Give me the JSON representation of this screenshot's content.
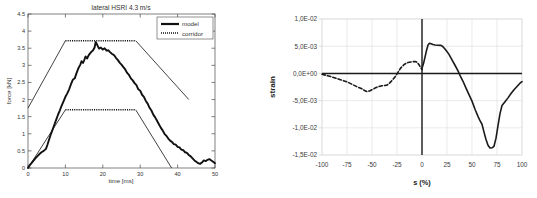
{
  "figure": {
    "background": "#ffffff",
    "panels": [
      "left-force-time-chart",
      "right-strain-s-chart"
    ]
  },
  "chart_data": [
    {
      "id": "lateral-hsri-force-time",
      "type": "line",
      "title": "lateral HSRI 4.3 m/s",
      "xlabel": "time [ms]",
      "ylabel": "force [kN]",
      "xlim": [
        0,
        50
      ],
      "ylim": [
        0,
        4.5
      ],
      "xticks": [
        "0",
        "10",
        "20",
        "30",
        "40",
        "50"
      ],
      "yticks": [
        "0",
        "0.5",
        "1",
        "1.5",
        "2",
        "2.5",
        "3",
        "3.5",
        "4",
        "4.5"
      ],
      "grid": false,
      "legend_position": "top-right",
      "legend": [
        {
          "label": "model",
          "style": "solid",
          "color": "#111111",
          "width": 2.2
        },
        {
          "label": "corridor",
          "style": "dotted",
          "color": "#111111",
          "width": 1.0
        }
      ],
      "series": [
        {
          "name": "model",
          "style": "solid",
          "color": "#111111",
          "points": [
            [
              0.0,
              0.0
            ],
            [
              0.6,
              0.1
            ],
            [
              1.2,
              0.18
            ],
            [
              1.8,
              0.26
            ],
            [
              2.4,
              0.33
            ],
            [
              3.0,
              0.4
            ],
            [
              3.6,
              0.46
            ],
            [
              4.2,
              0.5
            ],
            [
              4.8,
              0.56
            ],
            [
              5.2,
              0.68
            ],
            [
              5.6,
              0.82
            ],
            [
              6.0,
              0.95
            ],
            [
              6.5,
              1.1
            ],
            [
              7.0,
              1.25
            ],
            [
              7.5,
              1.4
            ],
            [
              8.0,
              1.55
            ],
            [
              8.5,
              1.68
            ],
            [
              9.0,
              1.82
            ],
            [
              9.5,
              1.95
            ],
            [
              10.0,
              2.08
            ],
            [
              10.5,
              2.18
            ],
            [
              11.0,
              2.3
            ],
            [
              11.5,
              2.45
            ],
            [
              12.0,
              2.58
            ],
            [
              12.5,
              2.62
            ],
            [
              13.0,
              2.78
            ],
            [
              13.5,
              2.92
            ],
            [
              14.0,
              3.02
            ],
            [
              14.3,
              3.12
            ],
            [
              14.7,
              3.07
            ],
            [
              15.0,
              3.14
            ],
            [
              15.4,
              3.26
            ],
            [
              15.8,
              3.2
            ],
            [
              16.2,
              3.29
            ],
            [
              16.6,
              3.35
            ],
            [
              17.0,
              3.4
            ],
            [
              17.4,
              3.44
            ],
            [
              17.8,
              3.52
            ],
            [
              18.1,
              3.68
            ],
            [
              18.5,
              3.6
            ],
            [
              19.0,
              3.49
            ],
            [
              19.5,
              3.52
            ],
            [
              20.0,
              3.46
            ],
            [
              20.5,
              3.5
            ],
            [
              21.0,
              3.43
            ],
            [
              21.5,
              3.44
            ],
            [
              22.0,
              3.38
            ],
            [
              22.5,
              3.33
            ],
            [
              23.0,
              3.3
            ],
            [
              23.5,
              3.22
            ],
            [
              24.0,
              3.16
            ],
            [
              24.5,
              3.08
            ],
            [
              25.0,
              3.02
            ],
            [
              25.5,
              2.95
            ],
            [
              26.0,
              2.88
            ],
            [
              26.5,
              2.78
            ],
            [
              27.0,
              2.72
            ],
            [
              27.5,
              2.62
            ],
            [
              28.0,
              2.56
            ],
            [
              28.5,
              2.48
            ],
            [
              29.0,
              2.42
            ],
            [
              29.5,
              2.3
            ],
            [
              30.0,
              2.26
            ],
            [
              30.5,
              2.14
            ],
            [
              31.0,
              2.08
            ],
            [
              31.5,
              1.96
            ],
            [
              32.0,
              1.88
            ],
            [
              32.5,
              1.76
            ],
            [
              33.0,
              1.68
            ],
            [
              33.5,
              1.56
            ],
            [
              34.0,
              1.48
            ],
            [
              34.5,
              1.38
            ],
            [
              35.0,
              1.28
            ],
            [
              35.5,
              1.18
            ],
            [
              36.0,
              1.1
            ],
            [
              36.5,
              1.0
            ],
            [
              37.0,
              0.94
            ],
            [
              37.5,
              0.86
            ],
            [
              38.0,
              0.8
            ],
            [
              38.5,
              0.76
            ],
            [
              39.0,
              0.7
            ],
            [
              39.5,
              0.68
            ],
            [
              40.0,
              0.62
            ],
            [
              40.5,
              0.6
            ],
            [
              41.0,
              0.54
            ],
            [
              41.5,
              0.52
            ],
            [
              42.0,
              0.46
            ],
            [
              42.5,
              0.44
            ],
            [
              43.0,
              0.38
            ],
            [
              43.5,
              0.34
            ],
            [
              44.0,
              0.28
            ],
            [
              44.5,
              0.22
            ],
            [
              45.0,
              0.18
            ],
            [
              45.5,
              0.14
            ],
            [
              46.0,
              0.12
            ],
            [
              46.5,
              0.16
            ],
            [
              47.0,
              0.22
            ],
            [
              47.5,
              0.2
            ],
            [
              48.0,
              0.24
            ],
            [
              48.5,
              0.26
            ],
            [
              49.0,
              0.22
            ],
            [
              49.5,
              0.18
            ],
            [
              50.0,
              0.14
            ]
          ]
        },
        {
          "name": "corridor-upper",
          "style": "mixed",
          "color": "#111111",
          "points": [
            [
              0.0,
              1.75
            ],
            [
              10.0,
              3.72
            ],
            [
              28.8,
              3.72
            ],
            [
              43.0,
              2.0
            ]
          ]
        },
        {
          "name": "corridor-lower",
          "style": "mixed",
          "color": "#111111",
          "points": [
            [
              0.0,
              0.0
            ],
            [
              10.0,
              1.7
            ],
            [
              28.8,
              1.7
            ],
            [
              38.4,
              0.0
            ]
          ]
        }
      ]
    },
    {
      "id": "strain-vs-s",
      "type": "line",
      "title": "",
      "xlabel": "s (%)",
      "ylabel": "strain",
      "xlim": [
        -100,
        100
      ],
      "ylim": [
        -0.015,
        0.01
      ],
      "xticks": [
        "-100",
        "-75",
        "-50",
        "-25",
        "0",
        "25",
        "50",
        "75",
        "100"
      ],
      "yticks": [
        "1,0E-02",
        "5,0E-03",
        "0,0E+00",
        "-5,0E-03",
        "-1,0E-02",
        "-1,5E-02"
      ],
      "grid": true,
      "legend_position": "none",
      "legend": [],
      "series": [
        {
          "name": "dashed-branch",
          "style": "dashed",
          "color": "#1a1a1a",
          "points": [
            [
              -100,
              -0.00015
            ],
            [
              -95,
              -0.0004
            ],
            [
              -90,
              -0.00065
            ],
            [
              -85,
              -0.00095
            ],
            [
              -80,
              -0.00125
            ],
            [
              -75,
              -0.00155
            ],
            [
              -70,
              -0.002
            ],
            [
              -65,
              -0.00245
            ],
            [
              -60,
              -0.00285
            ],
            [
              -57,
              -0.0032
            ],
            [
              -55,
              -0.00335
            ],
            [
              -52,
              -0.0032
            ],
            [
              -50,
              -0.003
            ],
            [
              -47,
              -0.0027
            ],
            [
              -44,
              -0.00245
            ],
            [
              -41,
              -0.0023
            ],
            [
              -38,
              -0.00225
            ],
            [
              -35,
              -0.00215
            ],
            [
              -32,
              -0.0017
            ],
            [
              -29,
              -0.0011
            ],
            [
              -26,
              -0.0004
            ],
            [
              -24,
              0.0002
            ],
            [
              -22,
              0.0008
            ],
            [
              -20,
              0.00125
            ],
            [
              -18,
              0.0016
            ],
            [
              -16,
              0.00185
            ],
            [
              -14,
              0.002
            ],
            [
              -11,
              0.0021
            ],
            [
              -9,
              0.00215
            ],
            [
              -7,
              0.0022
            ],
            [
              -5,
              0.00205
            ],
            [
              -3,
              0.0016
            ],
            [
              -1.5,
              0.0011
            ],
            [
              0,
              0.0007
            ]
          ]
        },
        {
          "name": "solid-branch",
          "style": "solid",
          "color": "#1a1a1a",
          "points": [
            [
              -100,
              -0.0001
            ],
            [
              -50,
              -0.0001
            ],
            [
              0,
              -0.0001
            ],
            [
              0,
              0.00095
            ],
            [
              1.5,
              0.0018
            ],
            [
              3,
              0.003
            ],
            [
              4.5,
              0.0042
            ],
            [
              6,
              0.0052
            ],
            [
              7.5,
              0.00555
            ],
            [
              9,
              0.00545
            ],
            [
              11,
              0.0053
            ],
            [
              13,
              0.00522
            ],
            [
              16,
              0.00518
            ],
            [
              19,
              0.00515
            ],
            [
              21,
              0.0049
            ],
            [
              24,
              0.00425
            ],
            [
              27,
              0.0035
            ],
            [
              30,
              0.0025
            ],
            [
              33,
              0.0015
            ],
            [
              36,
              0.00045
            ],
            [
              38,
              -0.00035
            ],
            [
              41,
              -0.00145
            ],
            [
              44,
              -0.0027
            ],
            [
              47,
              -0.0039
            ],
            [
              50,
              -0.0051
            ],
            [
              53,
              -0.0066
            ],
            [
              56,
              -0.0079
            ],
            [
              58,
              -0.0087
            ],
            [
              60,
              -0.00935
            ],
            [
              62,
              -0.0108
            ],
            [
              64,
              -0.01215
            ],
            [
              66,
              -0.0132
            ],
            [
              68,
              -0.0137
            ],
            [
              70,
              -0.01368
            ],
            [
              72,
              -0.0134
            ],
            [
              74,
              -0.0119
            ],
            [
              76,
              -0.0096
            ],
            [
              78,
              -0.0074
            ],
            [
              80,
              -0.0059
            ],
            [
              83,
              -0.0052
            ],
            [
              86,
              -0.0045
            ],
            [
              89,
              -0.0037
            ],
            [
              92,
              -0.003
            ],
            [
              95,
              -0.0024
            ],
            [
              98,
              -0.0018
            ],
            [
              100,
              -0.0015
            ]
          ]
        },
        {
          "name": "zero-axis-line",
          "style": "solid",
          "color": "#1a1a1a",
          "points": [
            [
              -100,
              0.0
            ],
            [
              100,
              0.0
            ]
          ]
        }
      ]
    }
  ]
}
